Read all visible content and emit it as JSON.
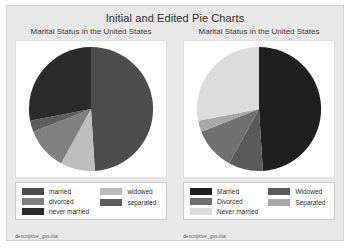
{
  "window": {
    "title": "Initial and Edited Pie Charts"
  },
  "colors": {
    "graph_region_background": "#e8e8e8",
    "plot_background": "#ffffff",
    "legend_border": "#c9c9c9",
    "title_text": "#2f2f2f"
  },
  "panels": [
    {
      "id": "initial-pie-chart",
      "subtitle": "Marital Status in the United States",
      "note": "descriptive_gss.dta",
      "legend": {
        "column1": [
          {
            "label": "married",
            "color": "#4d4d4d"
          },
          {
            "label": "divorced",
            "color": "#808080"
          },
          {
            "label": "never married",
            "color": "#2b2b2b"
          }
        ],
        "column2": [
          {
            "label": "widowed",
            "color": "#bdbdbd"
          },
          {
            "label": "separated",
            "color": "#5e5e5e"
          }
        ]
      }
    },
    {
      "id": "edited-pie-chart",
      "subtitle": "Marital Status in the United States",
      "note": "descriptive_gss.dta",
      "legend": {
        "column1": [
          {
            "label": "Married",
            "color": "#1f1f1f"
          },
          {
            "label": "Divorced",
            "color": "#707070"
          },
          {
            "label": "Never married",
            "color": "#dcdcdc"
          }
        ],
        "column2": [
          {
            "label": "Widowed",
            "color": "#5a5a5a"
          },
          {
            "label": "Separated",
            "color": "#a8a8a8"
          }
        ]
      }
    }
  ],
  "chart_data": [
    {
      "type": "pie",
      "title": "Marital Status in the United States",
      "subtitle": "",
      "chart_label": "Initial pie chart",
      "start_angle_deg": 0,
      "direction": "clockwise",
      "legend_position": "bottom",
      "categories": [
        "married",
        "divorced",
        "never married",
        "widowed",
        "separated"
      ],
      "values": [
        49,
        11,
        28,
        9,
        3
      ],
      "units": "percent",
      "slice_colors": [
        "#4d4d4d",
        "#808080",
        "#2b2b2b",
        "#bdbdbd",
        "#5e5e5e"
      ],
      "slice_order_clockwise": [
        "married",
        "widowed",
        "divorced",
        "separated",
        "never married"
      ]
    },
    {
      "type": "pie",
      "title": "Marital Status in the United States",
      "subtitle": "",
      "chart_label": "Edited pie chart",
      "start_angle_deg": 0,
      "direction": "clockwise",
      "legend_position": "bottom",
      "categories": [
        "Married",
        "Divorced",
        "Never married",
        "Widowed",
        "Separated"
      ],
      "values": [
        49,
        11,
        28,
        9,
        3
      ],
      "units": "percent",
      "slice_colors": [
        "#1f1f1f",
        "#707070",
        "#dcdcdc",
        "#5a5a5a",
        "#a8a8a8"
      ],
      "slice_order_clockwise": [
        "Married",
        "Widowed",
        "Divorced",
        "Separated",
        "Never married"
      ]
    }
  ]
}
